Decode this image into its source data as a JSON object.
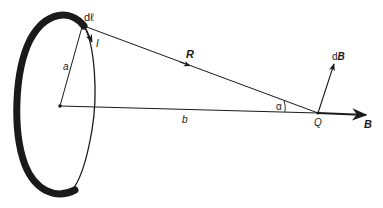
{
  "diagram": {
    "type": "physics-figure",
    "labels": {
      "dl": "dℓ",
      "current": "I",
      "radius": "a",
      "R_vector": "R",
      "dB_prefix": "d",
      "dB_vector": "B",
      "angle": "α",
      "distance": "b",
      "point": "Q",
      "B_field": "B"
    },
    "colors": {
      "ink": "#1a1a1a",
      "background": "#ffffff"
    }
  }
}
